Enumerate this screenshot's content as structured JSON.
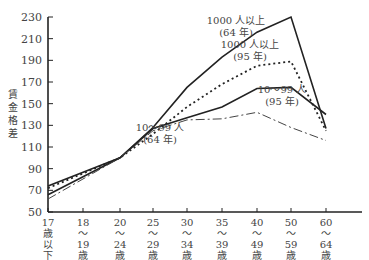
{
  "chart_data": {
    "type": "line",
    "title": "",
    "ylabel": "賃金格差",
    "xlabel": "",
    "ylim": [
      50,
      230
    ],
    "yticks": [
      50,
      70,
      90,
      110,
      130,
      150,
      170,
      190,
      210,
      230
    ],
    "grid": false,
    "categories": [
      [
        "17",
        "歳",
        "以",
        "下"
      ],
      [
        "18",
        "〜",
        "19",
        "歳"
      ],
      [
        "20",
        "〜",
        "24",
        "歳"
      ],
      [
        "25",
        "〜",
        "29",
        "歳"
      ],
      [
        "30",
        "〜",
        "34",
        "歳"
      ],
      [
        "35",
        "〜",
        "39",
        "歳"
      ],
      [
        "40",
        "〜",
        "49",
        "歳"
      ],
      [
        "50",
        "〜",
        "59",
        "歳"
      ],
      [
        "60",
        "〜",
        "64",
        "歳"
      ]
    ],
    "x_positions": [
      17,
      18,
      20,
      25,
      30,
      35,
      40,
      50,
      60
    ],
    "series": [
      {
        "name": "1000人以上(64年)",
        "label_lines": [
          "1000 人以上",
          "(64 年)"
        ],
        "style": "solid",
        "values": [
          null,
          null,
          100,
          128,
          165,
          193,
          216,
          230,
          127
        ],
        "start": [
          74,
          100
        ]
      },
      {
        "name": "1000人以上(95年)",
        "label_lines": [
          "1000 人以上",
          "(95 年)"
        ],
        "style": "dotted",
        "values": [
          null,
          null,
          100,
          122,
          147,
          168,
          185,
          189,
          125
        ],
        "start": [
          72,
          100
        ]
      },
      {
        "name": "10〜99人(95年)",
        "label_lines": [
          "10〜99 人",
          "(95 年)"
        ],
        "style": "solid",
        "values": [
          null,
          null,
          100,
          127,
          137,
          147,
          164,
          165,
          140
        ],
        "start": [
          66,
          100
        ]
      },
      {
        "name": "10〜99人(64年)",
        "label_lines": [
          "10〜99 人",
          "(64 年)"
        ],
        "style": "dashdot",
        "values": [
          null,
          null,
          100,
          125,
          135,
          136,
          142,
          128,
          116
        ],
        "start": [
          62,
          100
        ]
      }
    ],
    "legend": "inline labels"
  }
}
